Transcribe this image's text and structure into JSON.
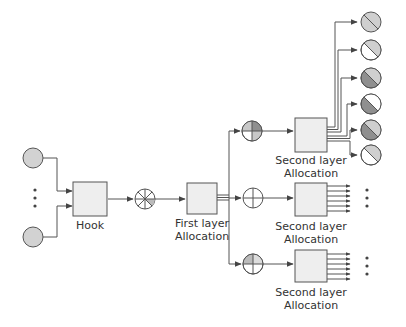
{
  "diagram": {
    "type": "flow",
    "colors": {
      "stroke": "#555555",
      "box_fill": "#eeeeee",
      "light": "#cfcfcf",
      "dark": "#8f8f8f",
      "white": "#ffffff",
      "input_fill": "#d2d2d2"
    },
    "inputs": {
      "count_shown": 2,
      "ellipsis": "⋮"
    },
    "nodes": {
      "hook": {
        "label": "Hook"
      },
      "first_layer": {
        "label_line1": "First layer",
        "label_line2": "Allocation"
      },
      "second_layers": [
        {
          "label_line1": "Second layer",
          "label_line2": "Allocation"
        },
        {
          "label_line1": "Second layer",
          "label_line2": "Allocation"
        },
        {
          "label_line1": "Second layer",
          "label_line2": "Allocation"
        }
      ]
    },
    "outputs_top": [
      {
        "top_right": "light",
        "bottom_left": "light"
      },
      {
        "top_right": "light",
        "bottom_left": "white"
      },
      {
        "top_right": "light",
        "bottom_left": "dark"
      },
      {
        "top_right": "white",
        "bottom_left": "dark"
      },
      {
        "top_right": "light",
        "bottom_left": "dark"
      },
      {
        "top_right": "light",
        "bottom_left": "white"
      }
    ],
    "ellipsis_right": "⋮"
  }
}
